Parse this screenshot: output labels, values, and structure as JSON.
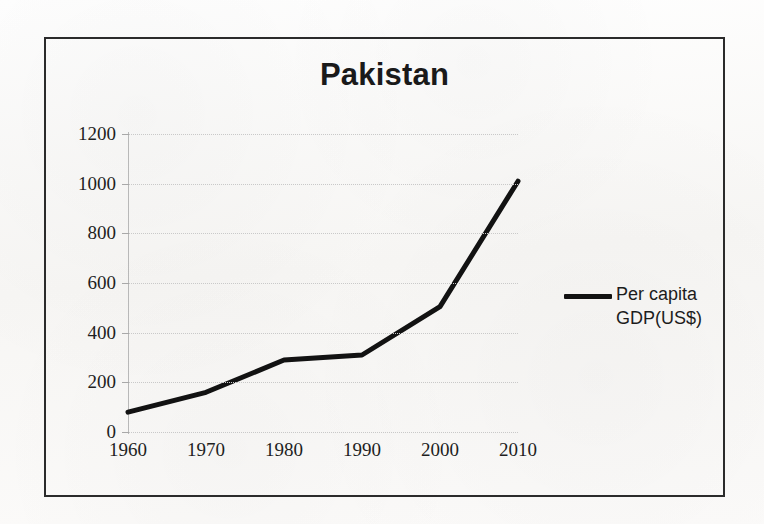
{
  "chart_data": {
    "type": "line",
    "title": "Pakistan",
    "xlabel": "",
    "ylabel": "",
    "x": [
      1960,
      1970,
      1980,
      1990,
      2000,
      2010
    ],
    "categories": [
      "1960",
      "1970",
      "1980",
      "1990",
      "2000",
      "2010"
    ],
    "series": [
      {
        "name": "Per capita GDP(US$)",
        "values": [
          80,
          160,
          290,
          310,
          505,
          1010
        ]
      }
    ],
    "ylim": [
      0,
      1200
    ],
    "yticks": [
      0,
      200,
      400,
      600,
      800,
      1000,
      1200
    ],
    "ytick_labels": [
      "0",
      "200",
      "400",
      "600",
      "800",
      "1000",
      "1200"
    ],
    "xtick_labels": [
      "1960",
      "1970",
      "1980",
      "1990",
      "2000",
      "2010"
    ],
    "grid": true,
    "legend_position": "right",
    "legend_entries": [
      {
        "label_line1": "Per capita",
        "label_line2": "GDP(US$)",
        "color": "#121212"
      }
    ]
  },
  "colors": {
    "series_line": "#121212",
    "axis_text": "#1e1e1e",
    "gridline": "#c9c9c9",
    "frame_border": "#2b2b2b",
    "paper_background": "#fbfbfa"
  }
}
